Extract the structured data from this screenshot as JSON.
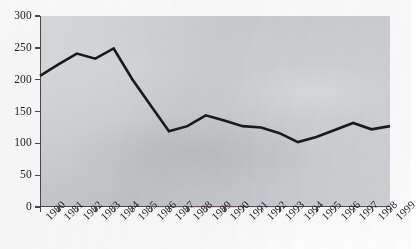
{
  "chart_data": {
    "type": "line",
    "title": "",
    "subtitle": "",
    "xlabel": "",
    "ylabel": "",
    "grid": false,
    "legend": "none",
    "x": [
      1980,
      1981,
      1982,
      1983,
      1984,
      1985,
      1986,
      1987,
      1988,
      1989,
      1990,
      1991,
      1992,
      1993,
      1994,
      1995,
      1996,
      1997,
      1998,
      1999
    ],
    "categories": [
      "1980",
      "1981",
      "1982",
      "1983",
      "1984",
      "1985",
      "1986",
      "1987",
      "1988",
      "1989",
      "1990",
      "1991",
      "1992",
      "1993",
      "1994",
      "1995",
      "1996",
      "1997",
      "1998",
      "1999"
    ],
    "values": [
      206,
      224,
      241,
      233,
      249,
      201,
      160,
      119,
      127,
      144,
      136,
      127,
      125,
      116,
      102,
      110,
      121,
      132,
      122,
      127
    ],
    "series": [
      {
        "name": "series-1",
        "values": [
          206,
          224,
          241,
          233,
          249,
          201,
          160,
          119,
          127,
          144,
          136,
          127,
          125,
          116,
          102,
          110,
          121,
          132,
          122,
          127
        ],
        "color": "#1a1a1a"
      }
    ],
    "ylim": [
      0,
      300
    ],
    "yticks": [
      0,
      50,
      100,
      150,
      200,
      250,
      300
    ],
    "ytick_labels": [
      "0",
      "50",
      "100",
      "150",
      "200",
      "250",
      "300"
    ],
    "xlim": [
      1980,
      1999
    ],
    "xtick_labels": [
      "1980",
      "1981",
      "1982",
      "1983",
      "1984",
      "1985",
      "1986",
      "1987",
      "1988",
      "1989",
      "1990",
      "1991",
      "1992",
      "1993",
      "1994",
      "1995",
      "1996",
      "1997",
      "1998",
      "1999"
    ],
    "xtick_rotation": -45
  },
  "style": {
    "plot_background": "#c9ccce",
    "axis_color": "#4a4a4c",
    "line_color": "#1a1a1a",
    "text_color": "#1d1d1f",
    "page_background": "#fdfdfd"
  }
}
